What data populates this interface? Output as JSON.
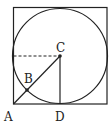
{
  "diagram": {
    "type": "geometry",
    "labels": {
      "A": "A",
      "B": "B",
      "C": "C",
      "D": "D"
    },
    "colors": {
      "stroke": "#222222",
      "background": "#ffffff"
    }
  }
}
